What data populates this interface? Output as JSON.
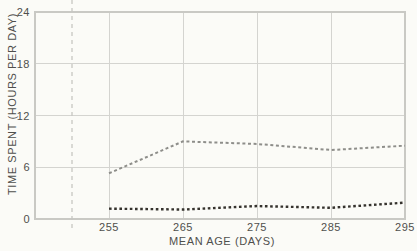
{
  "figure": {
    "background": "#fbfbf7"
  },
  "chart_data": {
    "type": "line",
    "title": "",
    "xlabel": "MEAN AGE (DAYS)",
    "ylabel": "TIME SPENT (HOURS PER DAY)",
    "x": [
      255,
      265,
      275,
      285,
      295
    ],
    "x_ticks": [
      255,
      265,
      275,
      285,
      295
    ],
    "y_ticks": [
      0,
      6,
      12,
      18,
      24
    ],
    "xlim": [
      245,
      295
    ],
    "ylim": [
      0,
      24
    ],
    "grid": true,
    "legend": "none",
    "series": [
      {
        "name": "upper-series-gray-dashed",
        "values": [
          5.3,
          9.0,
          8.7,
          8.0,
          8.5
        ],
        "color": "#8e8e8a",
        "dash": "3,2.6",
        "stroke_width": 2
      },
      {
        "name": "lower-series-black-dotted",
        "values": [
          1.2,
          1.1,
          1.5,
          1.3,
          1.9
        ],
        "color": "#35322d",
        "dash": "2.6,2.6",
        "stroke_width": 2.4
      }
    ],
    "reference_line": {
      "x": 250,
      "style": "dashed",
      "color": "#c7c7c2"
    },
    "axis_color": "#c9c9c4",
    "grid_color": "#d4d4d0",
    "tick_label_color": "#4f4f4c"
  }
}
